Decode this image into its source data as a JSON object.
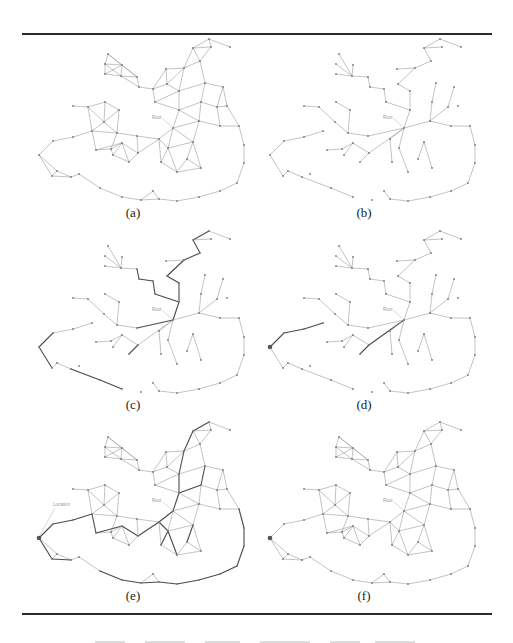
{
  "figure": {
    "panels": [
      {
        "id": "a",
        "label": "(a)",
        "mode": "graph",
        "dx": 0,
        "dy": 0,
        "label_x": 133,
        "label_y": 205,
        "highlight": false,
        "location": false
      },
      {
        "id": "b",
        "label": "(b)",
        "mode": "tree",
        "dx": 231,
        "dy": 0,
        "label_x": 364,
        "label_y": 205,
        "highlight": false,
        "location": false
      },
      {
        "id": "c",
        "label": "(c)",
        "mode": "tree",
        "dx": 0,
        "dy": 192,
        "label_x": 133,
        "label_y": 397,
        "highlight": "c",
        "location": false
      },
      {
        "id": "d",
        "label": "(d)",
        "mode": "tree",
        "dx": 231,
        "dy": 192,
        "label_x": 364,
        "label_y": 397,
        "highlight": "d",
        "location": true
      },
      {
        "id": "e",
        "label": "(e)",
        "mode": "graph",
        "dx": 0,
        "dy": 383,
        "label_x": 133,
        "label_y": 588,
        "highlight": "e",
        "location": true,
        "location_label": "Location"
      },
      {
        "id": "f",
        "label": "(f)",
        "mode": "graph",
        "dx": 231,
        "dy": 383,
        "label_x": 364,
        "label_y": 588,
        "highlight": false,
        "location": true
      }
    ],
    "root_label": "Root",
    "colors": {
      "edge": "#9a9a9a",
      "edge_highlight": "#4a4a4a",
      "node": "#7a7a7a",
      "location": "#555555",
      "rule": "#2a2a2a",
      "label_faint": "#9a9a9a"
    },
    "nodes": {
      "n0": [
        209,
        39
      ],
      "n1": [
        193,
        48
      ],
      "n2": [
        211,
        47
      ],
      "n3": [
        230,
        47
      ],
      "n4": [
        200,
        61
      ],
      "n5": [
        184,
        68
      ],
      "n6": [
        166,
        69
      ],
      "n7": [
        108,
        54
      ],
      "n8": [
        105,
        64
      ],
      "n9": [
        122,
        65
      ],
      "n10": [
        105,
        74
      ],
      "n11": [
        121,
        76
      ],
      "n12": [
        137,
        77
      ],
      "n13": [
        139,
        87
      ],
      "n14": [
        153,
        89
      ],
      "n15": [
        167,
        84
      ],
      "n16": [
        179,
        91
      ],
      "n17": [
        155,
        102
      ],
      "n18": [
        205,
        83
      ],
      "n19": [
        223,
        87
      ],
      "n20": [
        179,
        110
      ],
      "n21": [
        201,
        102
      ],
      "n22": [
        217,
        107
      ],
      "n23": [
        227,
        106
      ],
      "n24": [
        73,
        106
      ],
      "n25": [
        88,
        107
      ],
      "n26": [
        105,
        102
      ],
      "n27": [
        119,
        110
      ],
      "n28": [
        104,
        122
      ],
      "root": [
        173,
        128
      ],
      "n30": [
        199,
        121
      ],
      "n31": [
        220,
        126
      ],
      "n32": [
        239,
        126
      ],
      "n33": [
        53,
        141
      ],
      "n34": [
        73,
        137
      ],
      "n35": [
        92,
        131
      ],
      "n36": [
        117,
        133
      ],
      "n37": [
        137,
        136
      ],
      "n38": [
        39,
        155
      ],
      "n39": [
        96,
        150
      ],
      "n40": [
        111,
        149
      ],
      "n41": [
        122,
        143
      ],
      "n42": [
        113,
        155
      ],
      "n43": [
        159,
        139
      ],
      "n44": [
        168,
        148
      ],
      "n45": [
        193,
        142
      ],
      "n46": [
        138,
        153
      ],
      "n47": [
        129,
        162
      ],
      "n48": [
        161,
        162
      ],
      "n49": [
        187,
        159
      ],
      "n50": [
        177,
        172
      ],
      "n51": [
        201,
        168
      ],
      "n52": [
        244,
        145
      ],
      "n53": [
        244,
        163
      ],
      "n54": [
        237,
        183
      ],
      "n55": [
        52,
        176
      ],
      "n56": [
        57,
        171
      ],
      "n57": [
        71,
        177
      ],
      "n58": [
        79,
        174
      ],
      "n59": [
        100,
        188
      ],
      "n60": [
        122,
        197
      ],
      "n61": [
        141,
        200
      ],
      "n62": [
        153,
        191
      ],
      "n63": [
        159,
        199
      ],
      "n64": [
        177,
        201
      ],
      "n65": [
        199,
        197
      ],
      "n66": [
        220,
        191
      ]
    },
    "graph_edges": [
      [
        "n0",
        "n1"
      ],
      [
        "n0",
        "n2"
      ],
      [
        "n0",
        "n3"
      ],
      [
        "n1",
        "n2"
      ],
      [
        "n1",
        "n4"
      ],
      [
        "n2",
        "n4"
      ],
      [
        "n1",
        "n5"
      ],
      [
        "n4",
        "n5"
      ],
      [
        "n5",
        "n6"
      ],
      [
        "n4",
        "n18"
      ],
      [
        "n7",
        "n8"
      ],
      [
        "n7",
        "n9"
      ],
      [
        "n8",
        "n9"
      ],
      [
        "n8",
        "n10"
      ],
      [
        "n9",
        "n11"
      ],
      [
        "n10",
        "n11"
      ],
      [
        "n8",
        "n11"
      ],
      [
        "n9",
        "n10"
      ],
      [
        "n7",
        "n12"
      ],
      [
        "n9",
        "n12"
      ],
      [
        "n11",
        "n12"
      ],
      [
        "n11",
        "n13"
      ],
      [
        "n12",
        "n13"
      ],
      [
        "n13",
        "n14"
      ],
      [
        "n14",
        "n6"
      ],
      [
        "n14",
        "n15"
      ],
      [
        "n6",
        "n15"
      ],
      [
        "n15",
        "n5"
      ],
      [
        "n15",
        "n16"
      ],
      [
        "n5",
        "n16"
      ],
      [
        "n14",
        "n17"
      ],
      [
        "n16",
        "n17"
      ],
      [
        "n16",
        "n18"
      ],
      [
        "n18",
        "n19"
      ],
      [
        "n18",
        "n21"
      ],
      [
        "n19",
        "n22"
      ],
      [
        "n19",
        "n23"
      ],
      [
        "n21",
        "n22"
      ],
      [
        "n22",
        "n23"
      ],
      [
        "n16",
        "n20"
      ],
      [
        "n17",
        "n20"
      ],
      [
        "n20",
        "n21"
      ],
      [
        "n20",
        "n30"
      ],
      [
        "n21",
        "n30"
      ],
      [
        "n22",
        "n31"
      ],
      [
        "n23",
        "n32"
      ],
      [
        "n31",
        "n32"
      ],
      [
        "n30",
        "n31"
      ],
      [
        "n30",
        "root"
      ],
      [
        "n20",
        "root"
      ],
      [
        "n30",
        "n45"
      ],
      [
        "n24",
        "n25"
      ],
      [
        "n25",
        "n26"
      ],
      [
        "n26",
        "n27"
      ],
      [
        "n25",
        "n28"
      ],
      [
        "n26",
        "n28"
      ],
      [
        "n27",
        "n28"
      ],
      [
        "n25",
        "n35"
      ],
      [
        "n28",
        "n35"
      ],
      [
        "n28",
        "n36"
      ],
      [
        "n27",
        "n36"
      ],
      [
        "n33",
        "n34"
      ],
      [
        "n34",
        "n35"
      ],
      [
        "n33",
        "n38"
      ],
      [
        "n35",
        "n39"
      ],
      [
        "n35",
        "n36"
      ],
      [
        "n36",
        "n37"
      ],
      [
        "n36",
        "n40"
      ],
      [
        "n39",
        "n40"
      ],
      [
        "n39",
        "n41"
      ],
      [
        "n40",
        "n41"
      ],
      [
        "n41",
        "n42"
      ],
      [
        "n40",
        "n42"
      ],
      [
        "n41",
        "n46"
      ],
      [
        "n37",
        "n46"
      ],
      [
        "n37",
        "n43"
      ],
      [
        "n42",
        "n47"
      ],
      [
        "n46",
        "n47"
      ],
      [
        "n41",
        "n47"
      ],
      [
        "n43",
        "n44"
      ],
      [
        "n43",
        "root"
      ],
      [
        "root",
        "n44"
      ],
      [
        "root",
        "n45"
      ],
      [
        "n44",
        "n45"
      ],
      [
        "n43",
        "n48"
      ],
      [
        "n44",
        "n48"
      ],
      [
        "n44",
        "n50"
      ],
      [
        "n45",
        "n49"
      ],
      [
        "n45",
        "n51"
      ],
      [
        "n49",
        "n51"
      ],
      [
        "n48",
        "n50"
      ],
      [
        "n50",
        "n51"
      ],
      [
        "n49",
        "n50"
      ],
      [
        "n46",
        "n43"
      ],
      [
        "n32",
        "n52"
      ],
      [
        "n52",
        "n53"
      ],
      [
        "n53",
        "n54"
      ],
      [
        "n38",
        "n55"
      ],
      [
        "n38",
        "n56"
      ],
      [
        "n55",
        "n56"
      ],
      [
        "n56",
        "n57"
      ],
      [
        "n55",
        "n57"
      ],
      [
        "n57",
        "n58"
      ],
      [
        "n58",
        "n59"
      ],
      [
        "n59",
        "n60"
      ],
      [
        "n60",
        "n61"
      ],
      [
        "n61",
        "n62"
      ],
      [
        "n62",
        "n63"
      ],
      [
        "n61",
        "n63"
      ],
      [
        "n63",
        "n64"
      ],
      [
        "n64",
        "n65"
      ],
      [
        "n65",
        "n66"
      ],
      [
        "n66",
        "n54"
      ]
    ],
    "tree_edges": [
      [
        "n0",
        "n1"
      ],
      [
        "n0",
        "n3"
      ],
      [
        "n1",
        "n2"
      ],
      [
        "n1",
        "n4"
      ],
      [
        "n4",
        "n5"
      ],
      [
        "n5",
        "n6"
      ],
      [
        "n5",
        "n15"
      ],
      [
        "n15",
        "n16"
      ],
      [
        "n16",
        "n20"
      ],
      [
        "n20",
        "root"
      ],
      [
        "n7",
        "n11"
      ],
      [
        "n8",
        "n11"
      ],
      [
        "n10",
        "n11"
      ],
      [
        "n11",
        "n12"
      ],
      [
        "n12",
        "n13"
      ],
      [
        "n13",
        "n14"
      ],
      [
        "n14",
        "n17"
      ],
      [
        "n9",
        "n11"
      ],
      [
        "n17",
        "n20"
      ],
      [
        "n18",
        "n21"
      ],
      [
        "n21",
        "n30"
      ],
      [
        "n19",
        "n22"
      ],
      [
        "n22",
        "n30"
      ],
      [
        "n30",
        "root"
      ],
      [
        "n30",
        "n31"
      ],
      [
        "n31",
        "n32"
      ],
      [
        "n32",
        "n52"
      ],
      [
        "n52",
        "n53"
      ],
      [
        "n53",
        "n54"
      ],
      [
        "n54",
        "n66"
      ],
      [
        "n66",
        "n65"
      ],
      [
        "n65",
        "n64"
      ],
      [
        "n64",
        "n63"
      ],
      [
        "n63",
        "n62"
      ],
      [
        "n24",
        "n25"
      ],
      [
        "n25",
        "n28"
      ],
      [
        "n28",
        "n36"
      ],
      [
        "n26",
        "n27"
      ],
      [
        "n27",
        "n36"
      ],
      [
        "n36",
        "n37"
      ],
      [
        "n37",
        "root"
      ],
      [
        "n33",
        "n34"
      ],
      [
        "n34",
        "n35"
      ],
      [
        "n33",
        "n38"
      ],
      [
        "n38",
        "n55"
      ],
      [
        "n55",
        "n56"
      ],
      [
        "n56",
        "n57"
      ],
      [
        "n57",
        "n59"
      ],
      [
        "n59",
        "n60"
      ],
      [
        "n39",
        "n40"
      ],
      [
        "n40",
        "n41"
      ],
      [
        "n41",
        "n42"
      ],
      [
        "n41",
        "n46"
      ],
      [
        "n46",
        "n47"
      ],
      [
        "n46",
        "root"
      ],
      [
        "root",
        "n43"
      ],
      [
        "n43",
        "n48"
      ],
      [
        "root",
        "n44"
      ],
      [
        "n44",
        "n50"
      ],
      [
        "n49",
        "n45"
      ],
      [
        "n45",
        "n51"
      ]
    ],
    "highlight_paths": {
      "c": [
        [
          "n0",
          "n1"
        ],
        [
          "n1",
          "n4"
        ],
        [
          "n4",
          "n5"
        ],
        [
          "n5",
          "n15"
        ],
        [
          "n15",
          "n16"
        ],
        [
          "n16",
          "n20"
        ],
        [
          "n20",
          "root"
        ],
        [
          "n12",
          "n13"
        ],
        [
          "n13",
          "n14"
        ],
        [
          "n14",
          "n17"
        ],
        [
          "n17",
          "n20"
        ],
        [
          "root",
          "n37"
        ],
        [
          "n37",
          "n46"
        ],
        [
          "n46",
          "n47"
        ],
        [
          "n38",
          "n33"
        ],
        [
          "n38",
          "n55"
        ],
        [
          "n57",
          "n59"
        ],
        [
          "n59",
          "n60"
        ]
      ],
      "d": [
        [
          "n38",
          "n33"
        ],
        [
          "n33",
          "n34"
        ],
        [
          "n34",
          "n35"
        ],
        [
          "n35",
          "n39"
        ],
        [
          "n39",
          "n41"
        ],
        [
          "n41",
          "n47"
        ],
        [
          "n47",
          "n46"
        ],
        [
          "n46",
          "root"
        ]
      ],
      "e": [
        [
          "n38",
          "n33"
        ],
        [
          "n33",
          "n34"
        ],
        [
          "n34",
          "n35"
        ],
        [
          "n35",
          "n39"
        ],
        [
          "n39",
          "n41"
        ],
        [
          "n41",
          "n46"
        ],
        [
          "n46",
          "n43"
        ],
        [
          "n43",
          "root"
        ],
        [
          "root",
          "n20"
        ],
        [
          "n20",
          "n16"
        ],
        [
          "n16",
          "n5"
        ],
        [
          "n5",
          "n1"
        ],
        [
          "n1",
          "n0"
        ],
        [
          "n20",
          "n21"
        ],
        [
          "n21",
          "n18"
        ],
        [
          "n44",
          "n48"
        ],
        [
          "n44",
          "n50"
        ],
        [
          "n43",
          "n44"
        ],
        [
          "n45",
          "n49"
        ],
        [
          "n66",
          "n54"
        ],
        [
          "n54",
          "n53"
        ],
        [
          "n53",
          "n52"
        ],
        [
          "n52",
          "n32"
        ],
        [
          "n38",
          "n55"
        ],
        [
          "n55",
          "n57"
        ],
        [
          "n57",
          "n59"
        ],
        [
          "n59",
          "n60"
        ],
        [
          "n60",
          "n61"
        ],
        [
          "n61",
          "n63"
        ],
        [
          "n63",
          "n64"
        ],
        [
          "n64",
          "n65"
        ],
        [
          "n65",
          "n66"
        ]
      ]
    },
    "location_node": "n38"
  }
}
